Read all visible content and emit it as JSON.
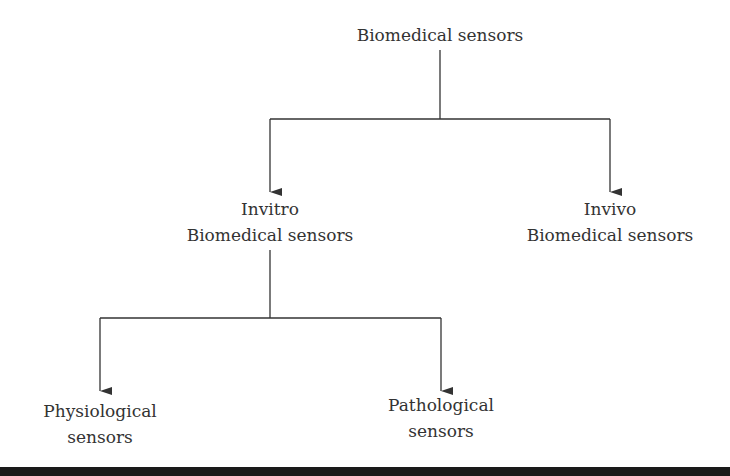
{
  "diagram": {
    "root": {
      "label": "Biomedical sensors"
    },
    "level1": [
      {
        "line1": "Invitro",
        "line2": "Biomedical sensors"
      },
      {
        "line1": "Invivo",
        "line2": "Biomedical sensors"
      }
    ],
    "level2": [
      {
        "line1": "Physiological",
        "line2": "sensors"
      },
      {
        "line1": "Pathological",
        "line2": "sensors"
      }
    ],
    "colors": {
      "line": "#333333",
      "text": "#333333",
      "bar": "#1a1a1a"
    }
  }
}
